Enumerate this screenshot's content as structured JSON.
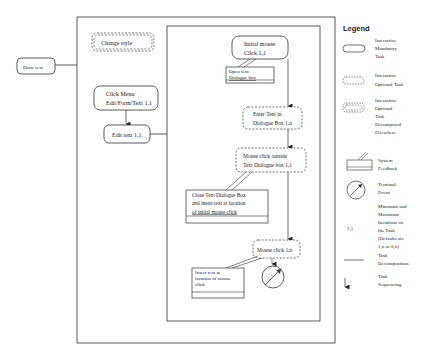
{
  "diagram": {
    "root_task": "Draw text",
    "outer_group": {
      "change_style": "Change style",
      "click_menu": [
        "Click Menu",
        "Edit/Form/Text 1,1"
      ],
      "edit_text": "Edit text 1,1"
    },
    "inner_group": {
      "initial_mouse": [
        "Initial mouse",
        "Click 1,1"
      ],
      "open_text_feedback": [
        "Open text",
        "Dialogue box"
      ],
      "enter_text": [
        "Enter Text in",
        "Dialogue Box 1,n"
      ],
      "mouse_click_outside": [
        "Mouse click outside",
        "Text Dialogue box  1,1"
      ],
      "close_text_feedback": [
        "Close Text Dialogue Box",
        "and insert text at location",
        "of initial mouse click"
      ],
      "mouse_click": "Mouse click 1,n",
      "insert_text_feedback": [
        "Insert text at",
        "location of mouse",
        "click"
      ]
    }
  },
  "legend": {
    "title": "Legend",
    "items": [
      {
        "symbol": "rounded-rect",
        "label": [
          "Interactive",
          "Mandatory",
          "Task"
        ]
      },
      {
        "symbol": "dashed-rounded-rect",
        "label": [
          "Interactive",
          "Optional Task"
        ]
      },
      {
        "symbol": "double-dashed-rounded-rect",
        "label": [
          "Interactive",
          "Optional",
          "Task",
          "Decomposed",
          "Elsewhere"
        ]
      },
      {
        "symbol": "feedback-box",
        "label": [
          "System",
          "Feedback"
        ]
      },
      {
        "symbol": "terminal-circle",
        "label": [
          "Terminal",
          "Event"
        ]
      },
      {
        "symbol": "1,1",
        "label": [
          "Minimum and",
          "Maximum",
          "Iterations on",
          "the Task",
          "(Defaults are",
          "1,n or 0,n)"
        ]
      },
      {
        "symbol": "line",
        "label": [
          "Task",
          "Decomposition"
        ]
      },
      {
        "symbol": "arrow",
        "label": [
          "Task",
          "Sequencing"
        ]
      }
    ]
  }
}
